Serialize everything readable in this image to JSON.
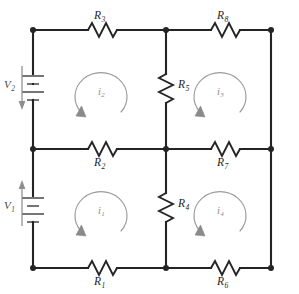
{
  "diagram": {
    "type": "electrical-circuit-schematic",
    "background_color": "#ffffff",
    "wire_color": "#242424",
    "loop_color": "#9a9a9a",
    "source_color": "#5d5d5d"
  },
  "sources": [
    {
      "id": "V2",
      "symbol": "V",
      "subscript": "2",
      "element": "battery",
      "position": "left-rail-upper",
      "arrow_direction": "down"
    },
    {
      "id": "V1",
      "symbol": "V",
      "subscript": "1",
      "element": "battery",
      "position": "left-rail-lower",
      "arrow_direction": "up"
    }
  ],
  "resistors": [
    {
      "id": "R1",
      "symbol": "R",
      "subscript": "1",
      "orientation": "horizontal",
      "branch": "bottom-left",
      "label_side": "below"
    },
    {
      "id": "R2",
      "symbol": "R",
      "subscript": "2",
      "orientation": "horizontal",
      "branch": "middle-left",
      "label_side": "below"
    },
    {
      "id": "R3",
      "symbol": "R",
      "subscript": "3",
      "orientation": "horizontal",
      "branch": "top-left",
      "label_side": "above"
    },
    {
      "id": "R4",
      "symbol": "R",
      "subscript": "4",
      "orientation": "vertical",
      "branch": "center-lower",
      "label_side": "right"
    },
    {
      "id": "R5",
      "symbol": "R",
      "subscript": "5",
      "orientation": "vertical",
      "branch": "center-upper",
      "label_side": "right"
    },
    {
      "id": "R6",
      "symbol": "R",
      "subscript": "6",
      "orientation": "horizontal",
      "branch": "bottom-right",
      "label_side": "below"
    },
    {
      "id": "R7",
      "symbol": "R",
      "subscript": "7",
      "orientation": "horizontal",
      "branch": "middle-right",
      "label_side": "below"
    },
    {
      "id": "R8",
      "symbol": "R",
      "subscript": "8",
      "orientation": "horizontal",
      "branch": "top-right",
      "label_side": "above"
    }
  ],
  "mesh_currents": [
    {
      "id": "i1",
      "symbol": "i",
      "subscript": "1",
      "mesh": "bottom-left",
      "direction": "clockwise"
    },
    {
      "id": "i2",
      "symbol": "i",
      "subscript": "2",
      "mesh": "top-left",
      "direction": "clockwise"
    },
    {
      "id": "i3",
      "symbol": "i",
      "subscript": "3",
      "mesh": "top-right",
      "direction": "clockwise"
    },
    {
      "id": "i4",
      "symbol": "i",
      "subscript": "4",
      "mesh": "bottom-right",
      "direction": "clockwise"
    }
  ],
  "nodes": [
    {
      "id": "n-tl",
      "label": "top-left"
    },
    {
      "id": "n-tm",
      "label": "top-middle"
    },
    {
      "id": "n-tr",
      "label": "top-right"
    },
    {
      "id": "n-ml",
      "label": "middle-left"
    },
    {
      "id": "n-mm",
      "label": "middle-middle"
    },
    {
      "id": "n-mr",
      "label": "middle-right"
    },
    {
      "id": "n-bl",
      "label": "bottom-left"
    },
    {
      "id": "n-bm",
      "label": "bottom-middle"
    },
    {
      "id": "n-br",
      "label": "bottom-right"
    }
  ]
}
